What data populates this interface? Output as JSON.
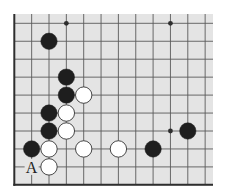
{
  "diagram": {
    "type": "go-board-fragment",
    "grid": {
      "columns": 12,
      "rows": 10,
      "origin_x": 14.3,
      "origin_y": 23.3,
      "spacing_x": 17.35,
      "spacing_y": 17.95,
      "edges": [
        "left",
        "bottom"
      ]
    },
    "colors": {
      "board": "#e4e4e4",
      "grid_line": "#5a5a5a",
      "edge_line": "#2e2e2e",
      "black_stone": "#1e1e1e",
      "white_stone": "#ffffff",
      "white_stone_border": "#333333",
      "label": "#222222"
    },
    "star_points": [
      {
        "col": 3,
        "row": 0
      },
      {
        "col": 9,
        "row": 0
      },
      {
        "col": 9,
        "row": 6
      }
    ],
    "stones": [
      {
        "color": "black",
        "col": 2,
        "row": 1
      },
      {
        "color": "black",
        "col": 3,
        "row": 3
      },
      {
        "color": "black",
        "col": 3,
        "row": 4
      },
      {
        "color": "white",
        "col": 4,
        "row": 4
      },
      {
        "color": "black",
        "col": 2,
        "row": 5
      },
      {
        "color": "white",
        "col": 3,
        "row": 5
      },
      {
        "color": "black",
        "col": 2,
        "row": 6
      },
      {
        "color": "white",
        "col": 3,
        "row": 6
      },
      {
        "color": "black",
        "col": 1,
        "row": 7
      },
      {
        "color": "white",
        "col": 2,
        "row": 7
      },
      {
        "color": "white",
        "col": 4,
        "row": 7
      },
      {
        "color": "white",
        "col": 6,
        "row": 7
      },
      {
        "color": "black",
        "col": 8,
        "row": 7
      },
      {
        "color": "black",
        "col": 10,
        "row": 6
      },
      {
        "color": "white",
        "col": 2,
        "row": 8
      }
    ],
    "labels": [
      {
        "text": "A",
        "col": 1,
        "row": 8
      }
    ]
  }
}
